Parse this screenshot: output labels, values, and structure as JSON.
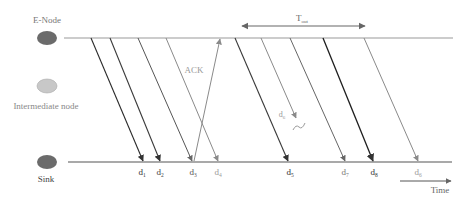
{
  "nodes": {
    "enode": {
      "label": "E-Node",
      "color": "#6b6b6b"
    },
    "intermediate": {
      "label": "Intermediate node",
      "color": "#c8c8c8"
    },
    "sink": {
      "label": "Sink",
      "color": "#6b6b6b"
    }
  },
  "timeline": {
    "top_y": 38,
    "bottom_y": 162,
    "start_x": 64,
    "end_x": 453
  },
  "packets": [
    {
      "id": "d1",
      "label": "d",
      "sub": "1",
      "x_start": 91,
      "x_end": 143,
      "color": "#2a2a2a",
      "label_color": "#333333"
    },
    {
      "id": "d2",
      "label": "d",
      "sub": "2",
      "x_start": 110,
      "x_end": 160,
      "color": "#3a3a3a",
      "label_color": "#444444"
    },
    {
      "id": "d3",
      "label": "d",
      "sub": "3",
      "x_start": 138,
      "x_end": 192,
      "color": "#555555",
      "label_color": "#555555"
    },
    {
      "id": "d4",
      "label": "d",
      "sub": "4",
      "x_start": 166,
      "x_end": 218,
      "color": "#8a8a8a",
      "label_color": "#9a9a9a"
    },
    {
      "id": "d5",
      "label": "d",
      "sub": "5",
      "x_start": 235,
      "x_end": 288,
      "color": "#3a3a3a",
      "label_color": "#333333"
    },
    {
      "id": "d7",
      "label": "d",
      "sub": "7",
      "x_start": 290,
      "x_end": 345,
      "color": "#666666",
      "label_color": "#777777"
    },
    {
      "id": "d8",
      "label": "d",
      "sub": "8",
      "x_start": 323,
      "x_end": 373,
      "color": "#1e1e1e",
      "label_color": "#333333"
    },
    {
      "id": "d6_retx",
      "label": "d",
      "sub": "6",
      "x_start": 364,
      "x_end": 418,
      "color": "#8a8a8a",
      "label_color": "#9a9a9a"
    }
  ],
  "lost_packet": {
    "label": "d",
    "sub": "6",
    "x_start": 261,
    "y_end": 118,
    "x_end": 296,
    "color": "#8a8a8a"
  },
  "ack": {
    "label": "ACK",
    "from_x": 194,
    "to_x": 220,
    "color": "#8a8a8a"
  },
  "timeout": {
    "label": "T",
    "sub": "out",
    "x1": 240,
    "x2": 367,
    "y": 26,
    "color": "#555555"
  },
  "time_axis": {
    "label": "Time",
    "x1": 400,
    "x2": 452,
    "y": 181,
    "color": "#555555"
  }
}
